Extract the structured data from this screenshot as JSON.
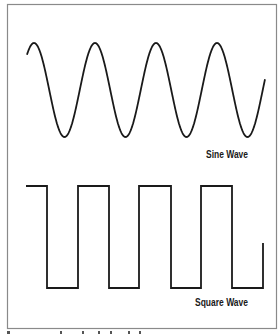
{
  "figure": {
    "sine": {
      "label": "Sine Wave",
      "cycles": 4,
      "period_px": 61,
      "center_y": 90,
      "amplitude_px": 47,
      "x_start": 27,
      "x_end": 265
    },
    "square": {
      "label": "Square Wave",
      "high_y": 186,
      "low_y": 288,
      "transitions_x": [
        26,
        47,
        78,
        109,
        139,
        171,
        201,
        232,
        263
      ],
      "end_y": 243
    },
    "colors": {
      "stroke": "#1a1a1a",
      "frame": "#8a8a8a",
      "background": "#ffffff"
    }
  }
}
